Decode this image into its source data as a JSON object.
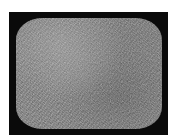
{
  "image": {
    "subject": "tv-static-screen",
    "description": "Rounded CRT television screen showing gray static noise inside a black frame",
    "colors": {
      "background": "#ffffff",
      "frame": "#0a0a0a",
      "screen_base": "#7a7a7a"
    }
  }
}
